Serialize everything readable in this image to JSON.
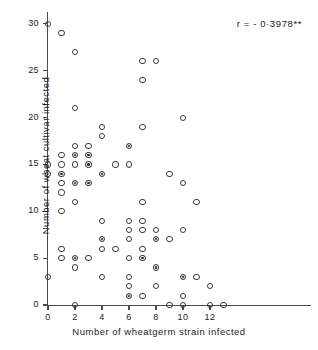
{
  "chart_data": {
    "type": "scatter",
    "title": "",
    "xlabel": "Number  of  wheatgerm  strain  infected",
    "ylabel": "Number of wheat cultivar infected",
    "xlim": [
      -0.4,
      13.6
    ],
    "ylim": [
      -0.6,
      31
    ],
    "xticks": [
      0,
      2,
      4,
      6,
      8,
      10,
      12
    ],
    "xticklabels": [
      "0",
      "2",
      "4",
      "6",
      "8",
      "10",
      "12"
    ],
    "yticks": [
      0,
      5,
      10,
      15,
      20,
      25,
      30
    ],
    "yticklabels": [
      "0",
      "5",
      "10",
      "15",
      "20",
      "25",
      "30"
    ],
    "grid": false,
    "legend": null,
    "annotation": "r = - 0·3978**",
    "marker_styles": {
      "open": "open circle (single observation)",
      "filled": "filled circle (multiple overlapping observations)"
    },
    "points": [
      {
        "x": 0,
        "y": 30,
        "fill": "open"
      },
      {
        "x": 0,
        "y": 15,
        "fill": "open"
      },
      {
        "x": 0,
        "y": 14,
        "fill": "open"
      },
      {
        "x": 0,
        "y": 3,
        "fill": "open"
      },
      {
        "x": 1,
        "y": 29,
        "fill": "open"
      },
      {
        "x": 1,
        "y": 16,
        "fill": "open"
      },
      {
        "x": 1,
        "y": 15,
        "fill": "open"
      },
      {
        "x": 1,
        "y": 14,
        "fill": "filled"
      },
      {
        "x": 1,
        "y": 13,
        "fill": "open"
      },
      {
        "x": 1,
        "y": 12,
        "fill": "open"
      },
      {
        "x": 1,
        "y": 10,
        "fill": "open"
      },
      {
        "x": 1,
        "y": 6,
        "fill": "open"
      },
      {
        "x": 1,
        "y": 5,
        "fill": "open"
      },
      {
        "x": 2,
        "y": 27,
        "fill": "open"
      },
      {
        "x": 2,
        "y": 21,
        "fill": "open"
      },
      {
        "x": 2,
        "y": 17,
        "fill": "open"
      },
      {
        "x": 2,
        "y": 16,
        "fill": "filled"
      },
      {
        "x": 2,
        "y": 15,
        "fill": "open"
      },
      {
        "x": 2,
        "y": 13,
        "fill": "filled"
      },
      {
        "x": 2,
        "y": 11,
        "fill": "open"
      },
      {
        "x": 2,
        "y": 5,
        "fill": "filled"
      },
      {
        "x": 2,
        "y": 4,
        "fill": "open"
      },
      {
        "x": 2,
        "y": 0,
        "fill": "open"
      },
      {
        "x": 3,
        "y": 17,
        "fill": "open"
      },
      {
        "x": 3,
        "y": 16,
        "fill": "filled"
      },
      {
        "x": 3,
        "y": 15,
        "fill": "filled"
      },
      {
        "x": 3,
        "y": 13,
        "fill": "filled"
      },
      {
        "x": 3,
        "y": 5,
        "fill": "open"
      },
      {
        "x": 4,
        "y": 19,
        "fill": "open"
      },
      {
        "x": 4,
        "y": 18,
        "fill": "open"
      },
      {
        "x": 4,
        "y": 14,
        "fill": "filled"
      },
      {
        "x": 4,
        "y": 9,
        "fill": "open"
      },
      {
        "x": 4,
        "y": 7,
        "fill": "filled"
      },
      {
        "x": 4,
        "y": 6,
        "fill": "open"
      },
      {
        "x": 4,
        "y": 3,
        "fill": "open"
      },
      {
        "x": 5,
        "y": 15,
        "fill": "open"
      },
      {
        "x": 5,
        "y": 6,
        "fill": "open"
      },
      {
        "x": 6,
        "y": 17,
        "fill": "filled"
      },
      {
        "x": 6,
        "y": 15,
        "fill": "open"
      },
      {
        "x": 6,
        "y": 9,
        "fill": "open"
      },
      {
        "x": 6,
        "y": 8,
        "fill": "open"
      },
      {
        "x": 6,
        "y": 7,
        "fill": "open"
      },
      {
        "x": 6,
        "y": 5,
        "fill": "open"
      },
      {
        "x": 6,
        "y": 3,
        "fill": "open"
      },
      {
        "x": 6,
        "y": 2,
        "fill": "open"
      },
      {
        "x": 6,
        "y": 1,
        "fill": "filled"
      },
      {
        "x": 7,
        "y": 26,
        "fill": "open"
      },
      {
        "x": 7,
        "y": 24,
        "fill": "open"
      },
      {
        "x": 7,
        "y": 19,
        "fill": "open"
      },
      {
        "x": 7,
        "y": 11,
        "fill": "open"
      },
      {
        "x": 7,
        "y": 9,
        "fill": "open"
      },
      {
        "x": 7,
        "y": 8,
        "fill": "open"
      },
      {
        "x": 7,
        "y": 6,
        "fill": "open"
      },
      {
        "x": 7,
        "y": 5,
        "fill": "filled"
      },
      {
        "x": 7,
        "y": 1,
        "fill": "open"
      },
      {
        "x": 8,
        "y": 26,
        "fill": "open"
      },
      {
        "x": 8,
        "y": 8,
        "fill": "open"
      },
      {
        "x": 8,
        "y": 7,
        "fill": "filled"
      },
      {
        "x": 8,
        "y": 4,
        "fill": "filled"
      },
      {
        "x": 8,
        "y": 2,
        "fill": "open"
      },
      {
        "x": 9,
        "y": 14,
        "fill": "open"
      },
      {
        "x": 9,
        "y": 7,
        "fill": "open"
      },
      {
        "x": 9,
        "y": 0,
        "fill": "open"
      },
      {
        "x": 10,
        "y": 20,
        "fill": "open"
      },
      {
        "x": 10,
        "y": 13,
        "fill": "open"
      },
      {
        "x": 10,
        "y": 8,
        "fill": "open"
      },
      {
        "x": 10,
        "y": 3,
        "fill": "filled"
      },
      {
        "x": 10,
        "y": 1,
        "fill": "open"
      },
      {
        "x": 10,
        "y": 0,
        "fill": "open"
      },
      {
        "x": 11,
        "y": 11,
        "fill": "open"
      },
      {
        "x": 11,
        "y": 3,
        "fill": "open"
      },
      {
        "x": 12,
        "y": 2,
        "fill": "open"
      },
      {
        "x": 12,
        "y": 0,
        "fill": "open"
      },
      {
        "x": 13,
        "y": 0,
        "fill": "open"
      }
    ]
  }
}
